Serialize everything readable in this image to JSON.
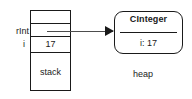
{
  "diagram": {
    "stack": {
      "region_label": "stack",
      "cells": [
        {
          "name": "empty-top",
          "text": ""
        },
        {
          "name": "reference-slot",
          "text": ""
        },
        {
          "name": "value-slot",
          "text": "17"
        },
        {
          "name": "region-slot",
          "text": "stack"
        }
      ],
      "variables": [
        {
          "name": "rInt",
          "label": "rInt"
        },
        {
          "name": "i",
          "label": "i"
        }
      ]
    },
    "heap": {
      "region_label": "heap",
      "object": {
        "class_name": "CInteger",
        "fields": [
          {
            "name": "i",
            "text": "i: 17"
          }
        ]
      }
    },
    "pointer": {
      "from": "rInt",
      "to": "CInteger",
      "arrow_glyph": "arrow-right"
    },
    "colors": {
      "stroke": "#1a1a1a",
      "arrow_line": "#4d4d4d",
      "background": "#ffffff",
      "text": "#1a1a1a"
    }
  }
}
